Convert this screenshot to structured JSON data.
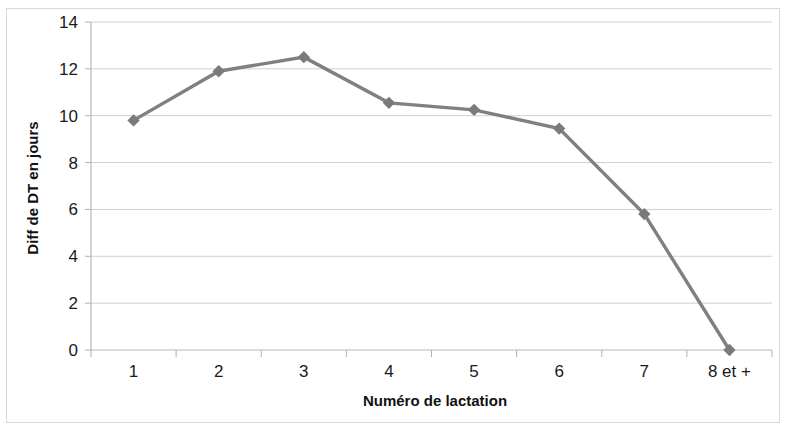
{
  "chart_data": {
    "type": "line",
    "title": "",
    "xlabel": "Numéro de lactation",
    "ylabel": "Diff de DT en jours",
    "categories": [
      "1",
      "2",
      "3",
      "4",
      "5",
      "6",
      "7",
      "8 et +"
    ],
    "values": [
      9.8,
      11.9,
      12.5,
      10.55,
      10.25,
      9.45,
      5.8,
      0.0
    ],
    "series": [
      {
        "name": "Diff de DT en jours",
        "values": [
          9.8,
          11.9,
          12.5,
          10.55,
          10.25,
          9.45,
          5.8,
          0.0
        ]
      }
    ],
    "ylim": [
      0,
      14
    ],
    "ytick_step": 2,
    "yticks": [
      "0",
      "2",
      "4",
      "6",
      "8",
      "10",
      "12",
      "14"
    ],
    "grid": true,
    "legend": "none",
    "line_color": "#808080",
    "marker_color": "#7a7a7a",
    "marker_shape": "diamond",
    "gridline_color": "#d0d0d0",
    "background_color": "#ffffff",
    "border_color": "#d8d8d8"
  }
}
